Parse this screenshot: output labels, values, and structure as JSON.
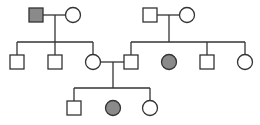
{
  "legend": {
    "square": "male",
    "circle": "female",
    "filled": "affected",
    "open": "unaffected"
  },
  "colors": {
    "affected": "#8a8a8a",
    "unaffected": "#ffffff",
    "line": "#333333"
  },
  "generations": [
    {
      "label": "I",
      "individuals": [
        {
          "id": "I-1",
          "sex": "male",
          "affected": true
        },
        {
          "id": "I-2",
          "sex": "female",
          "affected": false
        },
        {
          "id": "I-3",
          "sex": "male",
          "affected": false
        },
        {
          "id": "I-4",
          "sex": "female",
          "affected": false
        }
      ]
    },
    {
      "label": "II",
      "individuals": [
        {
          "id": "II-1",
          "sex": "male",
          "affected": false
        },
        {
          "id": "II-2",
          "sex": "male",
          "affected": false
        },
        {
          "id": "II-3",
          "sex": "female",
          "affected": false
        },
        {
          "id": "II-4",
          "sex": "male",
          "affected": false
        },
        {
          "id": "II-5",
          "sex": "female",
          "affected": true
        },
        {
          "id": "II-6",
          "sex": "male",
          "affected": false
        },
        {
          "id": "II-7",
          "sex": "female",
          "affected": false
        }
      ]
    },
    {
      "label": "III",
      "individuals": [
        {
          "id": "III-1",
          "sex": "male",
          "affected": false
        },
        {
          "id": "III-2",
          "sex": "female",
          "affected": true
        },
        {
          "id": "III-3",
          "sex": "female",
          "affected": false
        }
      ]
    }
  ]
}
